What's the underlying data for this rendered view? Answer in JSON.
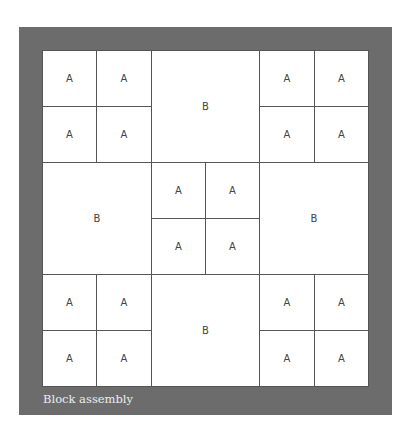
{
  "diagram": {
    "title": "Block assembly",
    "grid": {
      "columns": 6,
      "rows": 6
    },
    "colors": {
      "frame": "#6c6c6c",
      "block": "#ffffff",
      "line": "#555555",
      "label": "#444444",
      "caption": "#eeeeee"
    },
    "blocks": [
      {
        "label": "A",
        "col": 0,
        "row": 0,
        "w": 1,
        "h": 1
      },
      {
        "label": "A",
        "col": 1,
        "row": 0,
        "w": 1,
        "h": 1
      },
      {
        "label": "A",
        "col": 0,
        "row": 1,
        "w": 1,
        "h": 1
      },
      {
        "label": "A",
        "col": 1,
        "row": 1,
        "w": 1,
        "h": 1
      },
      {
        "label": "B",
        "col": 2,
        "row": 0,
        "w": 2,
        "h": 2
      },
      {
        "label": "A",
        "col": 4,
        "row": 0,
        "w": 1,
        "h": 1
      },
      {
        "label": "A",
        "col": 5,
        "row": 0,
        "w": 1,
        "h": 1
      },
      {
        "label": "A",
        "col": 4,
        "row": 1,
        "w": 1,
        "h": 1
      },
      {
        "label": "A",
        "col": 5,
        "row": 1,
        "w": 1,
        "h": 1
      },
      {
        "label": "B",
        "col": 0,
        "row": 2,
        "w": 2,
        "h": 2
      },
      {
        "label": "A",
        "col": 2,
        "row": 2,
        "w": 1,
        "h": 1
      },
      {
        "label": "A",
        "col": 3,
        "row": 2,
        "w": 1,
        "h": 1
      },
      {
        "label": "A",
        "col": 2,
        "row": 3,
        "w": 1,
        "h": 1
      },
      {
        "label": "A",
        "col": 3,
        "row": 3,
        "w": 1,
        "h": 1
      },
      {
        "label": "B",
        "col": 4,
        "row": 2,
        "w": 2,
        "h": 2
      },
      {
        "label": "A",
        "col": 0,
        "row": 4,
        "w": 1,
        "h": 1
      },
      {
        "label": "A",
        "col": 1,
        "row": 4,
        "w": 1,
        "h": 1
      },
      {
        "label": "A",
        "col": 0,
        "row": 5,
        "w": 1,
        "h": 1
      },
      {
        "label": "A",
        "col": 1,
        "row": 5,
        "w": 1,
        "h": 1
      },
      {
        "label": "B",
        "col": 2,
        "row": 4,
        "w": 2,
        "h": 2
      },
      {
        "label": "A",
        "col": 4,
        "row": 4,
        "w": 1,
        "h": 1
      },
      {
        "label": "A",
        "col": 5,
        "row": 4,
        "w": 1,
        "h": 1
      },
      {
        "label": "A",
        "col": 4,
        "row": 5,
        "w": 1,
        "h": 1
      },
      {
        "label": "A",
        "col": 5,
        "row": 5,
        "w": 1,
        "h": 1
      }
    ]
  }
}
